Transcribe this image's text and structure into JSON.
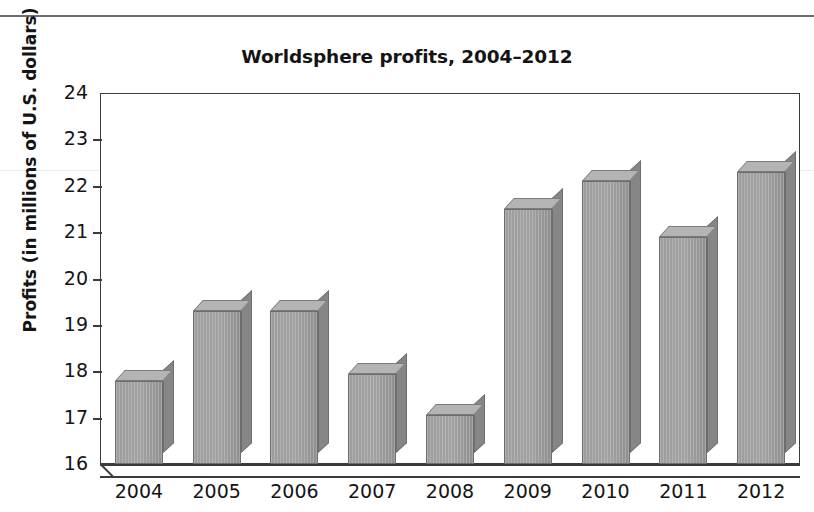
{
  "page": {
    "rule_present": true
  },
  "chart_data": {
    "type": "bar",
    "title": "Worldsphere profits, 2004–2012",
    "xlabel": "",
    "ylabel": "Profits (in millions of U.S. dollars)",
    "categories": [
      "2004",
      "2005",
      "2006",
      "2007",
      "2008",
      "2009",
      "2010",
      "2011",
      "2012"
    ],
    "values": [
      17.8,
      19.3,
      19.3,
      17.95,
      17.05,
      21.5,
      22.1,
      20.9,
      22.3
    ],
    "ylim": [
      16,
      24
    ],
    "ytick_labels": [
      "24",
      "23",
      "22",
      "21",
      "20",
      "19",
      "18",
      "17",
      "16"
    ],
    "ytick_values": [
      24,
      23,
      22,
      21,
      20,
      19,
      18,
      17,
      16
    ],
    "grid": false,
    "legend": false,
    "style": "3d-bars",
    "bar_color": "#9d9d9d",
    "bar_top_color": "#b4b4b4",
    "bar_side_color": "#868686",
    "axis_color": "#3b3b3b"
  }
}
